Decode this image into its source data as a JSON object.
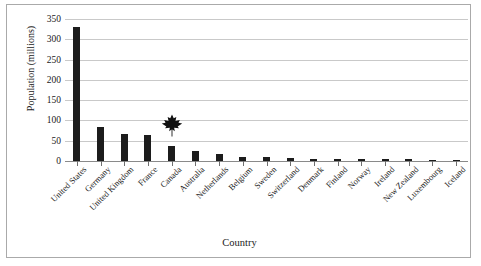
{
  "chart_data": {
    "type": "bar",
    "title": "",
    "xlabel": "Country",
    "ylabel": "Population (millions)",
    "ylim": [
      0,
      350
    ],
    "ytick_step": 50,
    "yticks": [
      350,
      300,
      250,
      200,
      150,
      100,
      50,
      0
    ],
    "grid": true,
    "legend": false,
    "bar_color": "#1c1c1c",
    "categories": [
      "United States",
      "Germany",
      "United Kingdom",
      "France",
      "Canada",
      "Australia",
      "Netherlands",
      "Belgium",
      "Sweden",
      "Switzerland",
      "Denmark",
      "Finland",
      "Norway",
      "Ireland",
      "New Zealand",
      "Luxembourg",
      "Iceland"
    ],
    "values": [
      330,
      84,
      67,
      65,
      38,
      25,
      17,
      11,
      10,
      8,
      6,
      5,
      5,
      5,
      5,
      1,
      0.5
    ],
    "annotations": [
      {
        "name": "maple-leaf-marker",
        "icon": "maple-leaf-icon",
        "category": "Canada",
        "value": 88,
        "color": "#111111"
      }
    ]
  }
}
